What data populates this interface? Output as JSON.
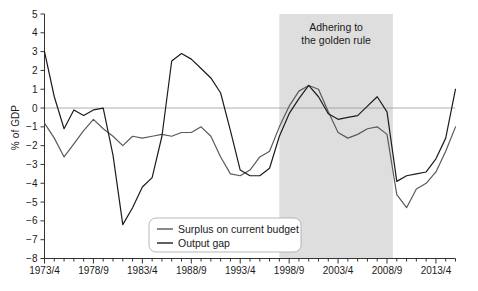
{
  "chart_data": {
    "type": "line",
    "title": "",
    "xlabel": "",
    "ylabel": "% of GDP",
    "ylim": [
      -8,
      5
    ],
    "yticks": [
      5,
      4,
      3,
      2,
      1,
      0,
      -1,
      -2,
      -3,
      -4,
      -5,
      -6,
      -7,
      -8
    ],
    "ytick_labels": [
      "5",
      "4",
      "3",
      "2",
      "1",
      "0",
      "−1",
      "−2",
      "−3",
      "−4",
      "−5",
      "−6",
      "−7",
      "−8"
    ],
    "xlim": [
      1973,
      2015
    ],
    "xtick_labels": [
      "1973/4",
      "1978/9",
      "1983/4",
      "1988/9",
      "1993/4",
      "1998/9",
      "2003/4",
      "2008/9",
      "2013/4"
    ],
    "xtick_years": [
      1973,
      1978,
      1983,
      1988,
      1993,
      1998,
      2003,
      2008,
      2013
    ],
    "minor_tick_step": 1,
    "grid": false,
    "zero_line": true,
    "legend_position": "bottom-center",
    "shaded_region": {
      "label": "Adhering to\nthe golden rule",
      "label_line1": "Adhering to",
      "label_line2": "the golden rule",
      "start_year": 1997,
      "end_year": 2008.6,
      "color": "#dedede"
    },
    "series": [
      {
        "name": "Surplus on current budget",
        "color": "#5a5a5a",
        "x": [
          1973,
          1974,
          1975,
          1976,
          1977,
          1978,
          1979,
          1980,
          1981,
          1982,
          1983,
          1984,
          1985,
          1986,
          1987,
          1988,
          1989,
          1990,
          1991,
          1992,
          1993,
          1994,
          1995,
          1996,
          1997,
          1998,
          1999,
          2000,
          2001,
          2002,
          2003,
          2004,
          2005,
          2006,
          2007,
          2008,
          2009,
          2010,
          2011,
          2012,
          2013,
          2014,
          2015
        ],
        "values": [
          -0.8,
          -1.6,
          -2.6,
          -1.9,
          -1.2,
          -0.6,
          -1.1,
          -1.5,
          -2.0,
          -1.5,
          -1.6,
          -1.5,
          -1.4,
          -1.5,
          -1.3,
          -1.3,
          -1.0,
          -1.5,
          -2.6,
          -3.5,
          -3.6,
          -3.3,
          -2.6,
          -2.3,
          -1.0,
          0.1,
          0.9,
          1.2,
          1.0,
          -0.2,
          -1.3,
          -1.6,
          -1.4,
          -1.1,
          -1.0,
          -1.4,
          -4.6,
          -5.3,
          -4.3,
          -4.0,
          -3.4,
          -2.3,
          -1.0
        ]
      },
      {
        "name": "Output gap",
        "color": "#1c1c1c",
        "x": [
          1973,
          1974,
          1975,
          1976,
          1977,
          1978,
          1979,
          1980,
          1981,
          1982,
          1983,
          1984,
          1985,
          1986,
          1987,
          1988,
          1989,
          1990,
          1991,
          1992,
          1993,
          1994,
          1995,
          1996,
          1997,
          1998,
          1999,
          2000,
          2001,
          2002,
          2003,
          2004,
          2005,
          2006,
          2007,
          2008,
          2009,
          2010,
          2011,
          2012,
          2013,
          2014,
          2015
        ],
        "values": [
          3.0,
          0.6,
          -1.1,
          -0.1,
          -0.4,
          -0.1,
          0.0,
          -2.5,
          -6.2,
          -5.3,
          -4.2,
          -3.7,
          -1.5,
          2.5,
          2.9,
          2.6,
          2.1,
          1.6,
          0.8,
          -1.2,
          -3.3,
          -3.6,
          -3.6,
          -3.2,
          -1.5,
          -0.3,
          0.5,
          1.2,
          0.6,
          -0.3,
          -0.6,
          -0.5,
          -0.4,
          0.1,
          0.6,
          -0.2,
          -3.9,
          -3.6,
          -3.5,
          -3.4,
          -2.7,
          -1.6,
          1.0
        ]
      }
    ]
  },
  "legend": {
    "items": [
      {
        "label": "Surplus on current budget",
        "color": "#5a5a5a"
      },
      {
        "label": "Output gap",
        "color": "#1c1c1c"
      }
    ]
  },
  "note": {
    "text": ""
  }
}
